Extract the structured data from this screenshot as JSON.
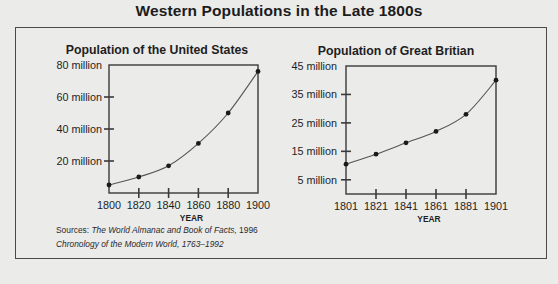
{
  "title": "Western Populations in the Late 1800s",
  "sources": {
    "line1_prefix": "Sources: ",
    "line1_title": "The World Almanac and Book of Facts,",
    "line1_suffix": " 1996",
    "line2": "Chronology of the Modern World, 1763–1992"
  },
  "colors": {
    "background": "#ebebea",
    "line": "#3a3a3a",
    "text": "#1e1e1e"
  },
  "chart_data": [
    {
      "type": "line",
      "title": "Population of the United States",
      "xlabel": "YEAR",
      "ylabel": "",
      "categories": [
        "1800",
        "1820",
        "1840",
        "1860",
        "1880",
        "1900"
      ],
      "x": [
        1800,
        1820,
        1840,
        1860,
        1880,
        1900
      ],
      "series": [
        {
          "name": "United States population (millions)",
          "values": [
            5,
            10,
            17,
            31,
            50,
            76
          ]
        }
      ],
      "yticks": [
        20,
        40,
        60,
        80
      ],
      "ytick_labels": [
        "20 million",
        "40 million",
        "60 million",
        "80 million"
      ],
      "ylim": [
        0,
        80
      ],
      "xlim": [
        1800,
        1900
      ],
      "grid": false,
      "legend": "none"
    },
    {
      "type": "line",
      "title": "Population of Great Britian",
      "xlabel": "YEAR",
      "ylabel": "",
      "categories": [
        "1801",
        "1821",
        "1841",
        "1861",
        "1881",
        "1901"
      ],
      "x": [
        1801,
        1821,
        1841,
        1861,
        1881,
        1901
      ],
      "series": [
        {
          "name": "Great Britain population (millions)",
          "values": [
            10.5,
            14,
            18,
            22,
            28,
            40
          ]
        }
      ],
      "yticks": [
        5,
        15,
        25,
        35,
        45
      ],
      "ytick_labels": [
        "5 million",
        "15 million",
        "25 million",
        "35 million",
        "45 million"
      ],
      "ylim": [
        0,
        45
      ],
      "xlim": [
        1801,
        1901
      ],
      "grid": false,
      "legend": "none"
    }
  ]
}
